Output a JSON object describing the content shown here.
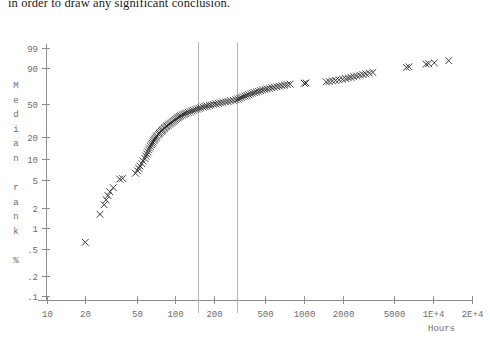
{
  "document": {
    "text_fragment": "in order to draw any significant conclusion."
  },
  "figure": {
    "y_axis_title": "Median rank %",
    "y_axis_title_chars": [
      "M",
      "e",
      "d",
      "i",
      "a",
      "n",
      "",
      "r",
      "a",
      "n",
      "k",
      "",
      "%"
    ],
    "x_axis_title": "Hours",
    "marker_glyph": "X",
    "colors": {
      "marker": "#2a2a2a",
      "axis": "#8d8d8d",
      "tick_label": "#6e6e6e",
      "reference_line": "#b4b4b4",
      "background": "#ffffff"
    }
  },
  "chart_data": {
    "type": "scatter",
    "title": "",
    "xlabel": "Hours",
    "ylabel": "Median rank %",
    "x_scale": "log10",
    "y_scale": "weibull-probability",
    "xlim": [
      10,
      20000
    ],
    "ylim": [
      0.1,
      99
    ],
    "grid": false,
    "legend": "none",
    "x_ticks": [
      10,
      20,
      50,
      100,
      200,
      500,
      1000,
      2000,
      5000,
      10000,
      20000
    ],
    "x_tick_labels": [
      "10",
      "20",
      "50",
      "100",
      "200",
      "500",
      "1000",
      "2000",
      "5000",
      "1E+4",
      "2E+4"
    ],
    "y_ticks": [
      99,
      90,
      50,
      20,
      10,
      5,
      2,
      1,
      0.5,
      0.2,
      0.1
    ],
    "y_tick_labels": [
      "99",
      "90",
      "50",
      "20",
      "10",
      "5",
      "2",
      "1",
      ".5",
      ".2",
      ".1"
    ],
    "annotations": [
      {
        "type": "vertical-line",
        "x": 150
      },
      {
        "type": "vertical-line",
        "x": 300
      }
    ],
    "series": [
      {
        "name": "failure times",
        "marker": "x",
        "points": [
          [
            20,
            0.62
          ],
          [
            26,
            1.6
          ],
          [
            28,
            2.2
          ],
          [
            29,
            2.6
          ],
          [
            30,
            3.0
          ],
          [
            31,
            3.4
          ],
          [
            33,
            3.9
          ],
          [
            37,
            5.2
          ],
          [
            39,
            5.3
          ],
          [
            49,
            6.3
          ],
          [
            51,
            6.8
          ],
          [
            52,
            7.4
          ],
          [
            53,
            8.0
          ],
          [
            55,
            8.6
          ],
          [
            56,
            9.4
          ],
          [
            58,
            10.2
          ],
          [
            59,
            11.0
          ],
          [
            60,
            11.8
          ],
          [
            61,
            12.6
          ],
          [
            62,
            13.4
          ],
          [
            63,
            14.2
          ],
          [
            64,
            15.0
          ],
          [
            65,
            15.8
          ],
          [
            66,
            16.5
          ],
          [
            67,
            17.2
          ],
          [
            68,
            18.0
          ],
          [
            69,
            18.7
          ],
          [
            70,
            19.4
          ],
          [
            71,
            20.1
          ],
          [
            72,
            20.8
          ],
          [
            74,
            21.6
          ],
          [
            75,
            22.3
          ],
          [
            76,
            23.0
          ],
          [
            78,
            23.7
          ],
          [
            79,
            24.4
          ],
          [
            80,
            25.1
          ],
          [
            82,
            25.8
          ],
          [
            83,
            26.5
          ],
          [
            85,
            27.2
          ],
          [
            86,
            27.9
          ],
          [
            88,
            28.6
          ],
          [
            90,
            29.3
          ],
          [
            92,
            30.0
          ],
          [
            94,
            30.8
          ],
          [
            96,
            31.6
          ],
          [
            98,
            32.4
          ],
          [
            100,
            33.2
          ],
          [
            102,
            34.0
          ],
          [
            104,
            34.8
          ],
          [
            106,
            35.5
          ],
          [
            108,
            36.2
          ],
          [
            110,
            36.9
          ],
          [
            113,
            37.6
          ],
          [
            116,
            38.3
          ],
          [
            119,
            39.0
          ],
          [
            122,
            39.7
          ],
          [
            126,
            40.4
          ],
          [
            130,
            41.1
          ],
          [
            134,
            41.8
          ],
          [
            138,
            42.5
          ],
          [
            143,
            43.2
          ],
          [
            148,
            43.9
          ],
          [
            153,
            44.6
          ],
          [
            158,
            45.3
          ],
          [
            164,
            46.0
          ],
          [
            170,
            46.7
          ],
          [
            176,
            47.3
          ],
          [
            183,
            47.9
          ],
          [
            190,
            48.5
          ],
          [
            198,
            49.1
          ],
          [
            206,
            49.7
          ],
          [
            215,
            50.3
          ],
          [
            224,
            50.9
          ],
          [
            234,
            51.5
          ],
          [
            245,
            52.1
          ],
          [
            256,
            52.7
          ],
          [
            268,
            53.3
          ],
          [
            281,
            54.0
          ],
          [
            295,
            54.8
          ],
          [
            305,
            55.6
          ],
          [
            315,
            56.5
          ],
          [
            325,
            57.4
          ],
          [
            336,
            58.3
          ],
          [
            347,
            59.2
          ],
          [
            358,
            60.1
          ],
          [
            370,
            61.0
          ],
          [
            383,
            61.9
          ],
          [
            396,
            62.8
          ],
          [
            410,
            63.6
          ],
          [
            425,
            64.4
          ],
          [
            441,
            65.2
          ],
          [
            458,
            66.0
          ],
          [
            476,
            66.8
          ],
          [
            495,
            67.5
          ],
          [
            515,
            68.2
          ],
          [
            537,
            68.9
          ],
          [
            560,
            69.6
          ],
          [
            585,
            70.3
          ],
          [
            612,
            71.0
          ],
          [
            640,
            71.6
          ],
          [
            670,
            72.2
          ],
          [
            703,
            72.8
          ],
          [
            738,
            73.4
          ],
          [
            775,
            74.0
          ],
          [
            1000,
            75.0
          ],
          [
            1030,
            75.4
          ],
          [
            1480,
            76.6
          ],
          [
            1560,
            77.2
          ],
          [
            1650,
            77.8
          ],
          [
            1750,
            78.4
          ],
          [
            1860,
            79.0
          ],
          [
            1980,
            79.6
          ],
          [
            2100,
            80.3
          ],
          [
            2200,
            81.0
          ],
          [
            2300,
            81.7
          ],
          [
            2420,
            82.4
          ],
          [
            2550,
            83.1
          ],
          [
            2700,
            83.8
          ],
          [
            2850,
            84.5
          ],
          [
            3000,
            85.2
          ],
          [
            3200,
            85.9
          ],
          [
            3400,
            86.6
          ],
          [
            6200,
            90.8
          ],
          [
            6500,
            91.2
          ],
          [
            8800,
            93.0
          ],
          [
            9200,
            93.3
          ],
          [
            10200,
            93.8
          ],
          [
            13200,
            95.0
          ]
        ]
      }
    ]
  }
}
